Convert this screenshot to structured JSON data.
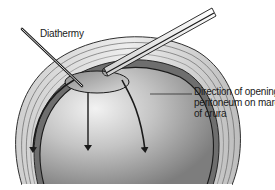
{
  "diagram": {
    "type": "surgical-illustration",
    "labels": {
      "diathermy": "Diathermy",
      "direction_line1": "Direction of opening",
      "direction_line2": "peritoneum on margin",
      "direction_line3": "of crura"
    },
    "elements": [
      "diathermy-instrument",
      "retractor-instrument",
      "oval-opening",
      "curved-arrow-left",
      "straight-arrow-center",
      "curved-arrow-right",
      "layered-tissue-dome"
    ],
    "colors": {
      "outline": "#1a1a1a",
      "dome_light": "#e8e8e8",
      "dome_dark": "#8a8a8a",
      "layer_gray": "#bdbdbd",
      "background": "#ffffff"
    }
  }
}
